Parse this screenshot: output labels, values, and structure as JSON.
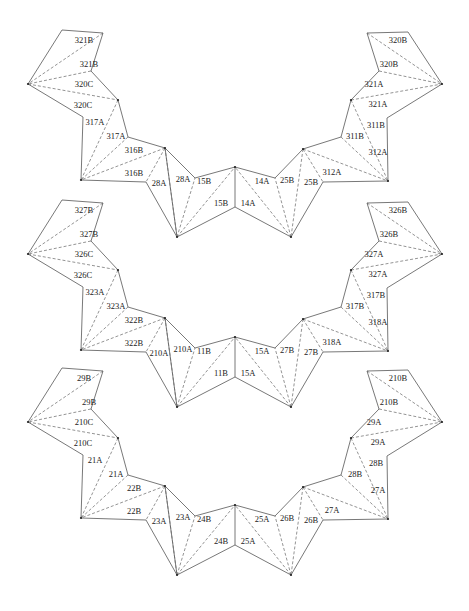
{
  "diagram": {
    "nets": [
      {
        "id": "net-1",
        "offset_y": 0,
        "labels": [
          "321B",
          "321B",
          "320C",
          "320C",
          "317A",
          "317A",
          "316B",
          "316B",
          "28A",
          "28A",
          "15B",
          "15B",
          "14A",
          "14A",
          "25B",
          "25B",
          "312A",
          "312A",
          "311B",
          "311B",
          "321A",
          "321A",
          "320B",
          "320B"
        ]
      },
      {
        "id": "net-2",
        "offset_y": 170,
        "labels": [
          "327B",
          "327B",
          "326C",
          "326C",
          "323A",
          "323A",
          "322B",
          "322B",
          "210A",
          "210A",
          "11B",
          "11B",
          "15A",
          "15A",
          "27B",
          "27B",
          "318A",
          "318A",
          "317B",
          "317B",
          "327A",
          "327A",
          "326B",
          "326B"
        ]
      },
      {
        "id": "net-3",
        "offset_y": 338,
        "labels": [
          "29B",
          "29B",
          "210C",
          "210C",
          "21A",
          "21A",
          "22B",
          "22B",
          "23A",
          "23A",
          "24B",
          "24B",
          "25A",
          "25A",
          "26B",
          "26B",
          "27A",
          "27A",
          "28B",
          "28B",
          "29A",
          "29A",
          "210B",
          "210B"
        ]
      }
    ],
    "geometry": {
      "vertices": {
        "a": [
          62,
          30
        ],
        "b": [
          103,
          33
        ],
        "c": [
          28,
          84
        ],
        "d": [
          91,
          71
        ],
        "e": [
          118,
          100
        ],
        "f": [
          83,
          117
        ],
        "g": [
          128,
          137
        ],
        "h": [
          81,
          180
        ],
        "i": [
          165,
          148
        ],
        "j": [
          146,
          182
        ],
        "k": [
          177,
          237
        ],
        "l": [
          195,
          178
        ],
        "m": [
          235,
          167
        ],
        "n": [
          235,
          207
        ],
        "l2": [
          275,
          178
        ],
        "i2": [
          303,
          149
        ],
        "j2": [
          323,
          182
        ],
        "k2": [
          291,
          237
        ],
        "g2": [
          341,
          137
        ],
        "h2": [
          388,
          181
        ],
        "e2": [
          351,
          100
        ],
        "f2": [
          387,
          118
        ],
        "d2": [
          379,
          71
        ],
        "c2": [
          442,
          84
        ],
        "a2": [
          367,
          33
        ],
        "b2": [
          408,
          32
        ]
      },
      "edges": [
        [
          "a",
          "b"
        ],
        [
          "b",
          "d"
        ],
        [
          "a",
          "c"
        ],
        [
          "d",
          "e"
        ],
        [
          "c",
          "f"
        ],
        [
          "e",
          "g"
        ],
        [
          "f",
          "h"
        ],
        [
          "g",
          "i"
        ],
        [
          "h",
          "j"
        ],
        [
          "i",
          "k"
        ],
        [
          "j",
          "k"
        ],
        [
          "i",
          "l"
        ],
        [
          "l",
          "m"
        ],
        [
          "m",
          "n"
        ],
        [
          "k",
          "n"
        ],
        [
          "m",
          "l2"
        ],
        [
          "n",
          "k2"
        ],
        [
          "l2",
          "i2"
        ],
        [
          "i2",
          "g2"
        ],
        [
          "k2",
          "j2"
        ],
        [
          "j2",
          "h2"
        ],
        [
          "g2",
          "e2"
        ],
        [
          "h2",
          "f2"
        ],
        [
          "e2",
          "d2"
        ],
        [
          "f2",
          "c2"
        ],
        [
          "d2",
          "a2"
        ],
        [
          "c2",
          "b2"
        ],
        [
          "a2",
          "b2"
        ]
      ],
      "folds": [
        [
          "b",
          "c"
        ],
        [
          "d",
          "c"
        ],
        [
          "c",
          "e"
        ],
        [
          "e",
          "h"
        ],
        [
          "g",
          "h"
        ],
        [
          "i",
          "h"
        ],
        [
          "i",
          "j"
        ],
        [
          "i",
          "k"
        ],
        [
          "k",
          "l"
        ],
        [
          "k",
          "m"
        ],
        [
          "k2",
          "l2"
        ],
        [
          "k2",
          "m"
        ],
        [
          "i2",
          "k2"
        ],
        [
          "i2",
          "j2"
        ],
        [
          "i2",
          "h2"
        ],
        [
          "g2",
          "h2"
        ],
        [
          "e2",
          "h2"
        ],
        [
          "e2",
          "c2"
        ],
        [
          "d2",
          "c2"
        ],
        [
          "a2",
          "c2"
        ]
      ],
      "dots": [
        "c",
        "e",
        "h",
        "i",
        "k",
        "m",
        "k2",
        "i2",
        "h2",
        "e2",
        "c2"
      ],
      "label_positions": [
        [
          84,
          41
        ],
        [
          89,
          65
        ],
        [
          84,
          85
        ],
        [
          83,
          106
        ],
        [
          95,
          123
        ],
        [
          116,
          137
        ],
        [
          134,
          151
        ],
        [
          134,
          174
        ],
        [
          159,
          184
        ],
        [
          183,
          180
        ],
        [
          204,
          182
        ],
        [
          221,
          204
        ],
        [
          262,
          182
        ],
        [
          248,
          204
        ],
        [
          287,
          181
        ],
        [
          311,
          183
        ],
        [
          336,
          181
        ],
        [
          332,
          173
        ],
        [
          355,
          137
        ],
        [
          376,
          126
        ],
        [
          374,
          85
        ],
        [
          378,
          105
        ],
        [
          389,
          65
        ],
        [
          398,
          41
        ]
      ]
    },
    "colors": {
      "line": "#555555",
      "text": "#222222",
      "background": "#ffffff"
    }
  }
}
